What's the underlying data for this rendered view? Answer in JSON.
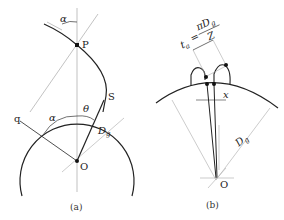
{
  "diagram_a": {
    "caption": "(a)",
    "labels": {
      "alpha_top": "α",
      "P": "P",
      "S": "S",
      "q": "q",
      "alpha_mid": "α",
      "theta": "θ",
      "Dg": "D",
      "Dg_sub": "g",
      "O": "O"
    }
  },
  "diagram_b": {
    "caption": "(b)",
    "labels": {
      "formula_lhs": "t",
      "formula_lhs_sub": "a",
      "formula_eq": "=",
      "formula_num": "πD",
      "formula_num_sub": "g",
      "formula_den": "Z",
      "x": "x",
      "Dg": "D",
      "Dg_sub": "g",
      "O": "O"
    }
  }
}
